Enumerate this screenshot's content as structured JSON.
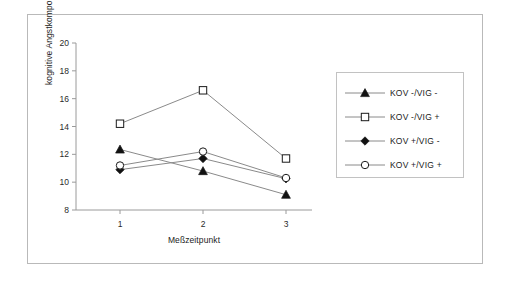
{
  "chart_data": {
    "type": "line",
    "title": "",
    "xlabel": "Meßzeitpunkt",
    "ylabel": "kognitive Angstkomponente",
    "categories": [
      "1",
      "2",
      "3"
    ],
    "x_tick_labels": [
      "1",
      "2",
      "3"
    ],
    "y_tick_labels": [
      "8",
      "10",
      "12",
      "14",
      "16",
      "18",
      "20"
    ],
    "ylim": [
      8,
      20
    ],
    "y_step": 2,
    "grid": false,
    "legend_position": "right",
    "series": [
      {
        "name": "KOV -/VIG -",
        "marker": "filled-triangle",
        "values": [
          12.35,
          10.8,
          9.1
        ]
      },
      {
        "name": "KOV -/VIG +",
        "marker": "open-square",
        "values": [
          14.2,
          16.6,
          11.7
        ]
      },
      {
        "name": "KOV +/VIG -",
        "marker": "filled-diamond",
        "values": [
          10.9,
          11.7,
          10.25
        ]
      },
      {
        "name": "KOV +/VIG +",
        "marker": "open-circle",
        "values": [
          11.2,
          12.2,
          10.3
        ]
      }
    ],
    "colors": {
      "line": "#8a8a8a",
      "marker_stroke": "#1a1a1a",
      "marker_fill_solid": "#111111",
      "marker_fill_open": "#ffffff",
      "axis": "#9a9a9a",
      "text": "#1b1b1b",
      "frame": "#b9b9b9",
      "background": "#ffffff"
    }
  }
}
